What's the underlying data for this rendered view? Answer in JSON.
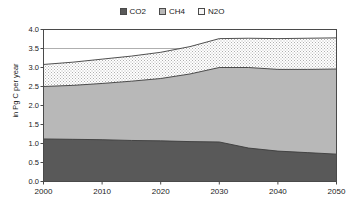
{
  "legend": {
    "position": "top-center",
    "entries": [
      {
        "label": "CO2",
        "color": "#595959",
        "swatch_name": "legend-swatch-co2"
      },
      {
        "label": "CH4",
        "color": "#b8b8b8",
        "swatch_name": "legend-swatch-ch4"
      },
      {
        "label": "N2O",
        "color": "#f2f2f2",
        "swatch_name": "legend-swatch-n2o"
      }
    ]
  },
  "axes": {
    "ylabel": "in Pg C per year",
    "xlabel": "",
    "yticks": [
      "0.0",
      "0.5",
      "1.0",
      "1.5",
      "2.0",
      "2.5",
      "3.0",
      "3.5",
      "4.0"
    ],
    "xticks": [
      "2000",
      "2010",
      "2020",
      "2030",
      "2040",
      "2050"
    ],
    "ylim": [
      0.0,
      4.0
    ],
    "xlim": [
      2000,
      2050
    ],
    "grid": "horizontal-major"
  },
  "colors": {
    "co2": "#595959",
    "ch4": "#b8b8b8",
    "n2o": "#f2f2f2",
    "outline": "#3c3c3c",
    "grid": "#9a9a9a",
    "axis": "#4a4a4a",
    "background": "#ffffff"
  },
  "chart_data": {
    "type": "area",
    "title": "",
    "subtitle": "",
    "xlabel": "",
    "ylabel": "in Pg C per year",
    "xlim": [
      2000,
      2050
    ],
    "ylim": [
      0.0,
      4.0
    ],
    "grid": true,
    "legend_position": "top-center",
    "stacked": true,
    "x": [
      2000,
      2005,
      2010,
      2015,
      2020,
      2025,
      2030,
      2035,
      2040,
      2045,
      2050
    ],
    "series": [
      {
        "name": "CO2",
        "color": "#595959",
        "values": [
          1.12,
          1.11,
          1.1,
          1.08,
          1.07,
          1.05,
          1.04,
          0.88,
          0.8,
          0.76,
          0.72
        ]
      },
      {
        "name": "CH4",
        "color": "#b8b8b8",
        "values": [
          1.38,
          1.42,
          1.48,
          1.56,
          1.64,
          1.78,
          1.96,
          2.12,
          2.15,
          2.19,
          2.24
        ]
      },
      {
        "name": "N2O",
        "color": "#f2f2f2",
        "values": [
          0.58,
          0.61,
          0.64,
          0.66,
          0.69,
          0.72,
          0.76,
          0.77,
          0.81,
          0.82,
          0.82
        ]
      }
    ],
    "cumulative": {
      "co2_top": [
        1.12,
        1.11,
        1.1,
        1.08,
        1.07,
        1.05,
        1.04,
        0.88,
        0.8,
        0.76,
        0.72
      ],
      "ch4_top": [
        2.5,
        2.53,
        2.58,
        2.64,
        2.71,
        2.83,
        3.0,
        3.0,
        2.95,
        2.95,
        2.96
      ],
      "n2o_top": [
        3.08,
        3.14,
        3.22,
        3.3,
        3.4,
        3.55,
        3.76,
        3.77,
        3.76,
        3.77,
        3.78
      ]
    },
    "annotations": []
  }
}
